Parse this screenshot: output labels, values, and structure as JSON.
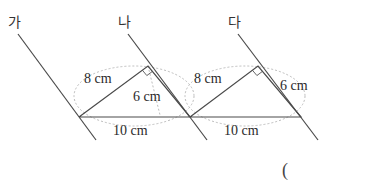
{
  "lines": [
    {
      "label": "가",
      "x1": 18,
      "y1": 34,
      "x2": 96,
      "y2": 140,
      "lx": 8,
      "ly": 27
    },
    {
      "label": "나",
      "x1": 128,
      "y1": 34,
      "x2": 207,
      "y2": 140,
      "lx": 118,
      "ly": 27
    },
    {
      "label": "다",
      "x1": 238,
      "y1": 34,
      "x2": 318,
      "y2": 140,
      "lx": 228,
      "ly": 27
    }
  ],
  "triangles": [
    {
      "A": [
        79,
        117
      ],
      "B": [
        148,
        66
      ],
      "C": [
        190,
        117
      ],
      "side_ab": "8 cm",
      "side_bc": "6 cm",
      "side_ac": "10 cm",
      "ab_pos": [
        84,
        83
      ],
      "bc_pos": [
        133,
        101
      ],
      "ac_pos": [
        113,
        135
      ]
    },
    {
      "A": [
        190,
        117
      ],
      "B": [
        258,
        66
      ],
      "C": [
        301,
        117
      ],
      "side_ab": "8 cm",
      "side_bc": "6 cm",
      "side_ac": "10 cm",
      "ab_pos": [
        194,
        83
      ],
      "bc_pos": [
        280,
        90
      ],
      "ac_pos": [
        224,
        135
      ]
    }
  ],
  "answer_paren": "("
}
